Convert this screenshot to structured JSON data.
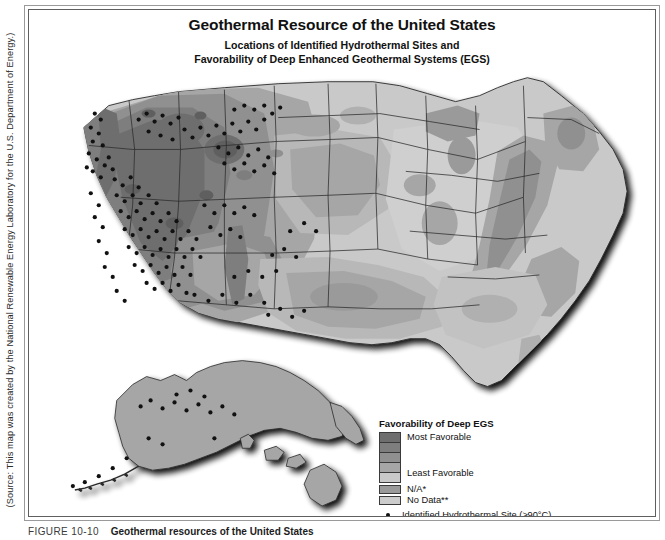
{
  "figure": {
    "source_credit": "(Source: This map was created by the National Renewable Energy Laboratory for the U.S. Department of Energy.)",
    "caption_number": "FIGURE 10-10",
    "caption_text": "Geothermal resources of the United States"
  },
  "map": {
    "title": "Geothermal Resource of the United States",
    "subtitle_line1": "Locations of Identified Hydrothermal Sites and",
    "subtitle_line2": "Favorability of Deep Enhanced Geothermal Systems (EGS)"
  },
  "legend": {
    "title": "Favorability of Deep EGS",
    "ramp_top_label": "Most Favorable",
    "ramp_bottom_label": "Least Favorable",
    "ramp_colors": [
      "#6e6e6e",
      "#7e7e7e",
      "#909090",
      "#a6a6a6",
      "#c9c9c9"
    ],
    "items": [
      {
        "label": "N/A*",
        "color": "#9a9a9a"
      },
      {
        "label": "No Data**",
        "color": "#cccccc"
      }
    ],
    "point_label": "Identified Hydrothermal Site (≥90°C)",
    "point_color": "#111111"
  },
  "chart_data": {
    "type": "map",
    "title": "Geothermal Resource of the United States",
    "subtitle": "Locations of Identified Hydrothermal Sites and Favorability of Deep Enhanced Geothermal Systems (EGS)",
    "projection": "Albers-like conic, contiguous US with Alaska and Hawaii insets",
    "color_scheme": "grayscale, dark = most favorable, light = least favorable",
    "legend_position": "bottom-right inside map frame",
    "classes": [
      {
        "rank": 1,
        "label": "Most Favorable",
        "color": "#6e6e6e"
      },
      {
        "rank": 2,
        "label": "",
        "color": "#7e7e7e"
      },
      {
        "rank": 3,
        "label": "",
        "color": "#909090"
      },
      {
        "rank": 4,
        "label": "",
        "color": "#a6a6a6"
      },
      {
        "rank": 5,
        "label": "Least Favorable",
        "color": "#c9c9c9"
      },
      {
        "rank": 6,
        "label": "N/A*",
        "color": "#9a9a9a"
      },
      {
        "rank": 7,
        "label": "No Data**",
        "color": "#cccccc"
      }
    ],
    "point_series": {
      "name": "Identified Hydrothermal Site (≥90°C)",
      "symbol": "filled circle",
      "color": "#111111",
      "concentration": "heavily clustered in Nevada, western Utah, Idaho, eastern California, Oregon, Wyoming; scattered in Alaska; none in eastern US"
    },
    "regions_summary": [
      {
        "region": "Great Basin (NV, UT, western ID)",
        "favorability": "Most Favorable",
        "hydrothermal_sites": "very high density"
      },
      {
        "region": "Pacific Northwest (OR, WA Cascades)",
        "favorability": "Most Favorable",
        "hydrothermal_sites": "high density"
      },
      {
        "region": "Northern Rockies (MT, WY, ID)",
        "favorability": "Most to moderately favorable",
        "hydrothermal_sites": "moderate density"
      },
      {
        "region": "Southwest (AZ, NM, CO)",
        "favorability": "Moderately favorable",
        "hydrothermal_sites": "moderate density"
      },
      {
        "region": "Great Plains (TX, OK, KS, NE, SD)",
        "favorability": "Moderate to least favorable",
        "hydrothermal_sites": "very sparse"
      },
      {
        "region": "Midwest and Great Lakes",
        "favorability": "Least Favorable",
        "hydrothermal_sites": "none"
      },
      {
        "region": "Appalachians / Eastern Seaboard",
        "favorability": "Least favorable with isolated moderate bands",
        "hydrothermal_sites": "none"
      },
      {
        "region": "Gulf Coast",
        "favorability": "Moderately favorable",
        "hydrothermal_sites": "none"
      },
      {
        "region": "Alaska",
        "favorability": "N/A*",
        "hydrothermal_sites": "scattered, Aleutians and interior"
      },
      {
        "region": "Hawaii",
        "favorability": "N/A*",
        "hydrothermal_sites": "none shown"
      }
    ]
  }
}
